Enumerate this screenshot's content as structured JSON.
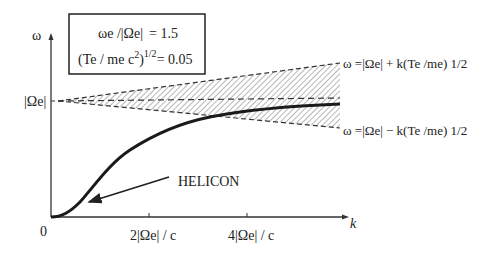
{
  "figure": {
    "type": "dispersion-diagram",
    "y_axis_label": "ω",
    "x_axis_label": "k",
    "origin_label": "0",
    "y_reference_label": "|Ωe|",
    "x_ticks": [
      {
        "label_prefix": "2",
        "label_core": "|Ωe| / c",
        "position_value": 2
      },
      {
        "label_prefix": "4",
        "label_core": "|Ωe| / c",
        "position_value": 4
      }
    ],
    "parameter_box": {
      "line1": "ωe / |Ωe|  = 1.5",
      "line2": "(Te / me c²)^1/2 = 0.05",
      "line1_lhs": "ωe /|Ωe|",
      "line1_rhs": "= 1.5",
      "line2_lhs": "(Te / me c",
      "line2_sup": "2",
      "line2_close": ")",
      "line2_exp": "1/2",
      "line2_rhs": "= 0.05"
    },
    "upper_bound_label": "ω =|Ωe| + k(Te /me) 1/2",
    "lower_bound_label": "ω =|Ωe| − k(Te /me) 1/2",
    "curve_label": "HELICON",
    "colors": {
      "ink": "#222222",
      "hatch": "#555555",
      "background": "#ffffff"
    }
  }
}
